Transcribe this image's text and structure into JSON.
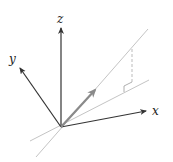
{
  "diagram": {
    "type": "3d-vector-projection",
    "axes": {
      "x": {
        "label": "x",
        "color": "#333333"
      },
      "y": {
        "label": "y",
        "color": "#333333"
      },
      "z": {
        "label": "z",
        "color": "#333333"
      }
    },
    "vector": {
      "color": "#8a8a8a",
      "description": "vector from origin"
    },
    "lines": {
      "steep_line_color": "#bdbdbd",
      "plane_line_color": "#bdbdbd",
      "dashed_projection_color": "#aaaaaa"
    },
    "right_angle_marker": true
  }
}
